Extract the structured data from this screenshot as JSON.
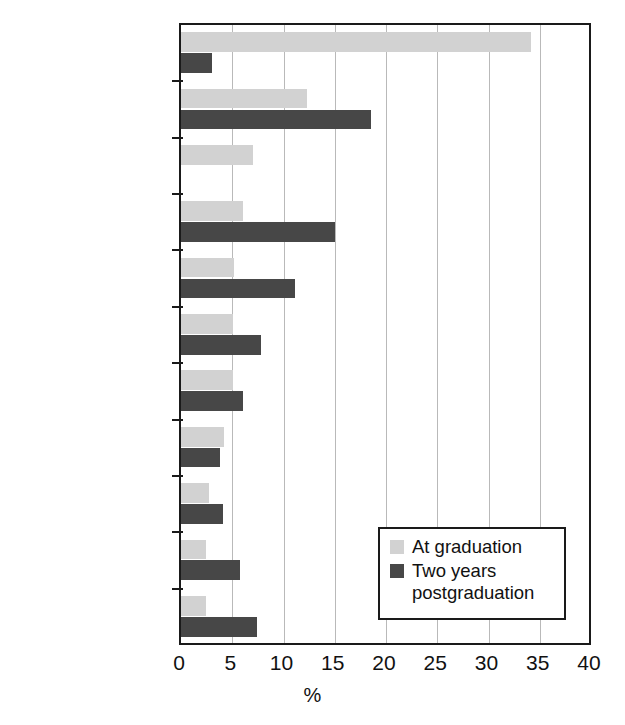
{
  "chart_data": {
    "type": "bar",
    "orientation": "horizontal",
    "title": "",
    "xlabel": "%",
    "ylabel": "",
    "xlim": [
      0,
      40
    ],
    "xticks": [
      0,
      5,
      10,
      15,
      20,
      25,
      30,
      35,
      40
    ],
    "grid": true,
    "legend_position": "inside-bottom-right",
    "categories": [
      "Corrections",
      "Child welfare",
      "Youth services",
      "Mental health",
      "Aging",
      "Family\nservices",
      "Developmental\ndisabilities",
      "Substance\nabuse",
      "Crisis\nintervention",
      "School\nsocial work",
      "Health care"
    ],
    "series": [
      {
        "name": "At graduation",
        "color": "#d2d2d2",
        "values": [
          34.1,
          12.3,
          7.0,
          6.0,
          5.2,
          5.1,
          5.1,
          4.2,
          2.7,
          2.4,
          2.4
        ]
      },
      {
        "name": "Two years\npostgraduation",
        "color": "#474747",
        "values": [
          3.0,
          18.5,
          0,
          15.0,
          11.1,
          7.8,
          6.0,
          3.8,
          4.1,
          5.8,
          7.4
        ]
      }
    ]
  },
  "legend": {
    "items": [
      {
        "label": "At graduation",
        "color": "#d2d2d2"
      },
      {
        "label": "Two years\npostgraduation",
        "color": "#474747"
      }
    ]
  },
  "axis": {
    "x_title": "%",
    "tick_labels": [
      "0",
      "5",
      "10",
      "15",
      "20",
      "25",
      "30",
      "35",
      "40"
    ]
  }
}
